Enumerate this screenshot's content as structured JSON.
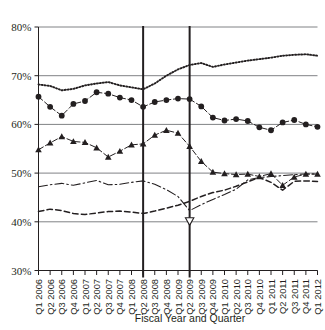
{
  "chart_data": {
    "type": "line",
    "title": "",
    "subtitle": "",
    "xlabel": "Fiscal Year and Quarter",
    "ylabel": "",
    "ylim": [
      30,
      80
    ],
    "ytick_labels": [
      "80%",
      "70%",
      "60%",
      "50%",
      "40%",
      "30%"
    ],
    "ytick_values": [
      80,
      70,
      60,
      50,
      40,
      30
    ],
    "grid": "horizontal",
    "legend_position": "none",
    "annotations": [
      {
        "type": "vertical-reference-line",
        "x": "Q2 2008"
      },
      {
        "type": "vertical-reference-line",
        "x": "Q2 2009"
      }
    ],
    "categories": [
      "Q1 2006",
      "Q2 2006",
      "Q3 2006",
      "Q4 2006",
      "Q1 2007",
      "Q2 2007",
      "Q3 2007",
      "Q4 2007",
      "Q1 2008",
      "Q2 2008",
      "Q3 2008",
      "Q4 2008",
      "Q1 2009",
      "Q2 2009",
      "Q3 2009",
      "Q4 2009",
      "Q1 2010",
      "Q2 2010",
      "Q3 2010",
      "Q4 2010",
      "Q1 2011",
      "Q2 2011",
      "Q3 2011",
      "Q4 2011",
      "Q1 2012"
    ],
    "series": [
      {
        "name": "series-dotted-upper",
        "style": "dotted",
        "marker": "none",
        "color": "#231f20",
        "values": [
          68.2,
          67.9,
          67.0,
          67.3,
          68.0,
          68.4,
          68.7,
          68.0,
          67.6,
          67.2,
          68.4,
          70.0,
          71.3,
          72.2,
          72.6,
          71.8,
          72.3,
          72.7,
          73.1,
          73.4,
          73.7,
          74.1,
          74.3,
          74.4,
          74.1
        ]
      },
      {
        "name": "series-circle-markers",
        "style": "dash-dot",
        "marker": "circle",
        "color": "#231f20",
        "values": [
          65.7,
          63.6,
          61.8,
          64.2,
          64.8,
          66.6,
          66.3,
          65.5,
          65.0,
          63.6,
          64.6,
          65.0,
          65.3,
          65.2,
          63.7,
          61.4,
          60.8,
          61.1,
          60.7,
          59.4,
          58.8,
          60.4,
          60.9,
          60.0,
          59.5
        ]
      },
      {
        "name": "series-triangle-markers",
        "style": "dash-dot",
        "marker": "triangle-up",
        "color": "#231f20",
        "values": [
          54.8,
          56.2,
          57.5,
          56.5,
          56.3,
          55.2,
          53.3,
          54.5,
          55.8,
          56.0,
          57.8,
          58.8,
          58.2,
          55.5,
          52.4,
          50.2,
          49.9,
          49.7,
          49.8,
          49.3,
          49.9,
          47.5,
          49.2,
          49.8,
          49.8
        ]
      },
      {
        "name": "series-thin-dash-dot",
        "style": "dash-dot-thin",
        "marker": "none",
        "color": "#231f20",
        "values": [
          47.2,
          47.6,
          47.9,
          47.5,
          48.0,
          48.5,
          47.6,
          47.7,
          48.1,
          48.4,
          47.7,
          46.6,
          45.2,
          42.3,
          43.5,
          44.6,
          45.6,
          46.7,
          48.6,
          49.1,
          49.3,
          49.5,
          49.7,
          49.8,
          49.8
        ]
      },
      {
        "name": "series-dashed",
        "style": "dashed",
        "marker": "none",
        "color": "#231f20",
        "values": [
          42.1,
          42.6,
          42.3,
          41.7,
          41.5,
          41.8,
          42.1,
          42.2,
          42.0,
          41.7,
          42.2,
          42.8,
          43.4,
          44.2,
          45.2,
          46.0,
          46.5,
          47.3,
          48.2,
          49.1,
          48.1,
          46.5,
          48.3,
          48.4,
          48.3
        ]
      },
      {
        "name": "series-solid",
        "style": "solid",
        "marker": "none",
        "marker_points": [
          {
            "x": "Q2 2009",
            "value": 40.1,
            "marker": "triangle-down-hollow"
          }
        ],
        "values": [
          41.8,
          42.4,
          41.4,
          41.1,
          41.0,
          40.6,
          39.6,
          40.5,
          41.0,
          41.1,
          41.6,
          42.5,
          43.4,
          45.0,
          41.0,
          39.1,
          38.4,
          38.0,
          37.8,
          37.9,
          38.3,
          38.5,
          37.7,
          37.2,
          38.8
        ]
      }
    ]
  }
}
